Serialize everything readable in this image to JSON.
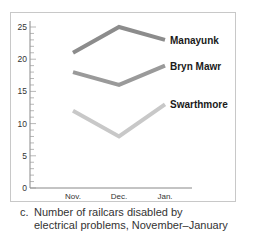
{
  "chart_data": {
    "type": "line",
    "title": "",
    "xlabel": "",
    "ylabel": "",
    "categories": [
      "Nov.",
      "Dec.",
      "Jan."
    ],
    "ylim": [
      0,
      25
    ],
    "yticks": [
      0,
      5,
      10,
      15,
      20,
      25
    ],
    "minor_tick_step": 1,
    "grid": false,
    "legend_position": "inline-right",
    "series": [
      {
        "name": "Manayunk",
        "values": [
          21,
          25,
          23
        ],
        "color": "#8c8c8c"
      },
      {
        "name": "Bryn Mawr",
        "values": [
          18,
          16,
          19
        ],
        "color": "#9a9a9a"
      },
      {
        "name": "Swarthmore",
        "values": [
          12,
          8,
          13
        ],
        "color": "#c8c8c8"
      }
    ]
  },
  "caption": {
    "letter": "c.",
    "line1": "Number of railcars disabled by",
    "line2": "electrical problems, November–January"
  }
}
